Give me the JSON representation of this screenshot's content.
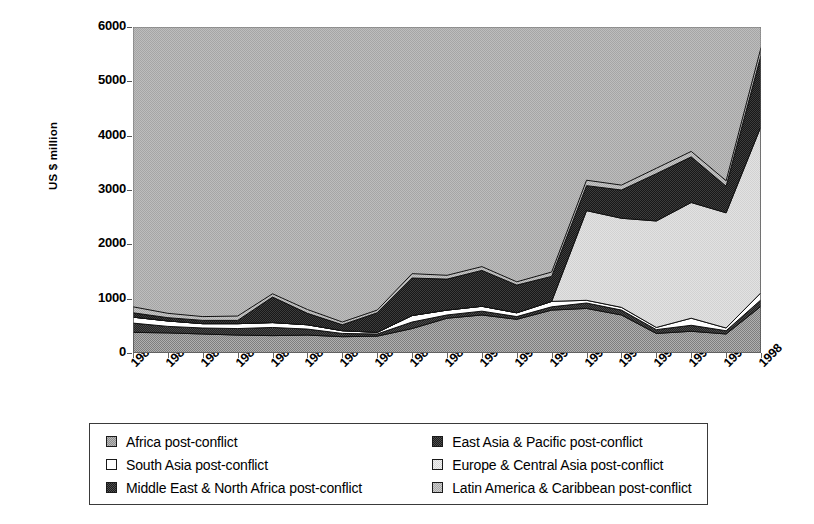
{
  "chart_data": {
    "type": "area",
    "stacked": true,
    "title": "",
    "subtitle": "",
    "xlabel": "",
    "ylabel": "US $ million",
    "xlim": [
      1980,
      1998
    ],
    "ylim": [
      0,
      6000
    ],
    "ytick_interval": 1000,
    "grid": false,
    "legend_position": "bottom",
    "plot_background": "#b5b5b5",
    "categories": [
      "1980",
      "1981",
      "1982",
      "1983",
      "1984",
      "1985",
      "1986",
      "1987",
      "1988",
      "1989",
      "1990",
      "1991",
      "1992",
      "1993",
      "1994",
      "1995",
      "1996",
      "1997",
      "1998"
    ],
    "yticks": [
      "0",
      "1000",
      "2000",
      "3000",
      "4000",
      "5000",
      "6000"
    ],
    "series": [
      {
        "name": "Africa post-conflict",
        "color": "#9a9a9a",
        "pattern": "medium-gray-dither",
        "values": [
          380,
          370,
          350,
          330,
          320,
          330,
          300,
          310,
          450,
          640,
          700,
          620,
          790,
          820,
          700,
          360,
          400,
          350,
          860
        ]
      },
      {
        "name": "East Asia & Pacific post-conflict",
        "color": "#3a3a3a",
        "pattern": "dark-dither",
        "values": [
          170,
          120,
          110,
          120,
          150,
          110,
          60,
          40,
          120,
          60,
          70,
          50,
          60,
          100,
          90,
          70,
          110,
          60,
          120
        ]
      },
      {
        "name": "South Asia post-conflict",
        "color": "#ffffff",
        "pattern": "white",
        "values": [
          110,
          100,
          80,
          90,
          90,
          80,
          50,
          30,
          120,
          90,
          90,
          70,
          100,
          50,
          50,
          40,
          130,
          50,
          130
        ]
      },
      {
        "name": "Europe & Central Asia post-conflict",
        "color": "#dcdcdc",
        "pattern": "light-gray",
        "values": [
          0,
          0,
          0,
          0,
          0,
          0,
          0,
          0,
          0,
          0,
          0,
          0,
          0,
          1650,
          1640,
          1960,
          2130,
          2120,
          3060
        ]
      },
      {
        "name": "Middle East & North Africa post-conflict",
        "color": "#2b2b2b",
        "pattern": "dark-solid-dither",
        "values": [
          80,
          60,
          60,
          60,
          470,
          210,
          110,
          360,
          690,
          570,
          660,
          510,
          460,
          460,
          520,
          870,
          840,
          490,
          1310
        ]
      },
      {
        "name": "Latin America & Caribbean post-conflict",
        "color": "#c4c4c4",
        "pattern": "light-medium-dither",
        "values": [
          110,
          80,
          70,
          80,
          60,
          70,
          50,
          50,
          80,
          70,
          70,
          60,
          80,
          100,
          90,
          100,
          100,
          100,
          140
        ]
      }
    ],
    "totals": [
      850,
      730,
      670,
      680,
      1090,
      800,
      570,
      790,
      1460,
      1430,
      1590,
      1310,
      1490,
      3180,
      3090,
      3400,
      3710,
      3170,
      5620
    ]
  },
  "legend": {
    "items": [
      {
        "label": "Africa post-conflict",
        "swatch": "#9a9a9a"
      },
      {
        "label": "South Asia post-conflict",
        "swatch": "#ffffff"
      },
      {
        "label": "Middle East & North Africa post-conflict",
        "swatch": "#2b2b2b"
      },
      {
        "label": "East Asia & Pacific post-conflict",
        "swatch": "#3a3a3a"
      },
      {
        "label": "Europe & Central Asia post-conflict",
        "swatch": "#dcdcdc"
      },
      {
        "label": "Latin America & Caribbean post-conflict",
        "swatch": "#c4c4c4"
      }
    ]
  }
}
